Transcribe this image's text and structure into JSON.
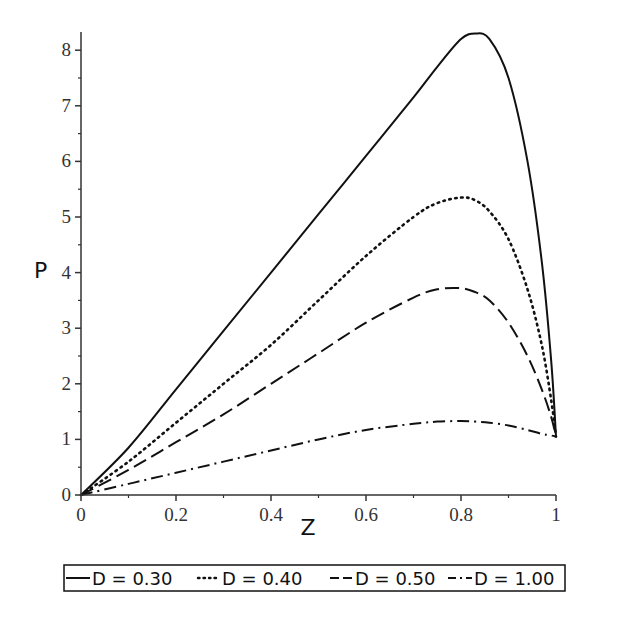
{
  "chart_data": {
    "type": "line",
    "title": "",
    "xlabel": "Z",
    "ylabel": "P",
    "xlim": [
      0,
      1
    ],
    "ylim": [
      0,
      8.3
    ],
    "grid": false,
    "legend_position": "bottom",
    "x_ticks": [
      "0",
      "0.2",
      "0.4",
      "0.6",
      "0.8",
      "1"
    ],
    "y_ticks": [
      "0",
      "1",
      "2",
      "3",
      "4",
      "5",
      "6",
      "7",
      "8"
    ],
    "x": [
      0,
      0.1,
      0.2,
      0.3,
      0.4,
      0.5,
      0.6,
      0.7,
      0.75,
      0.8,
      0.83,
      0.86,
      0.9,
      0.94,
      0.97,
      0.99,
      1.0
    ],
    "series": [
      {
        "name": "D = 0.30",
        "style": "solid",
        "values": [
          0,
          0.85,
          1.9,
          2.95,
          4.0,
          5.05,
          6.1,
          7.15,
          7.7,
          8.2,
          8.3,
          8.2,
          7.5,
          6.0,
          4.2,
          2.4,
          1.05
        ]
      },
      {
        "name": "D = 0.40",
        "style": "dotted",
        "values": [
          0,
          0.6,
          1.3,
          2.0,
          2.7,
          3.5,
          4.3,
          5.0,
          5.25,
          5.35,
          5.3,
          5.1,
          4.6,
          3.7,
          2.7,
          1.7,
          1.05
        ]
      },
      {
        "name": "D = 0.50",
        "style": "dashed",
        "values": [
          0,
          0.45,
          0.95,
          1.45,
          2.0,
          2.55,
          3.1,
          3.55,
          3.7,
          3.72,
          3.65,
          3.5,
          3.1,
          2.5,
          1.9,
          1.4,
          1.05
        ]
      },
      {
        "name": "D = 1.00",
        "style": "dashdot",
        "values": [
          0,
          0.2,
          0.4,
          0.6,
          0.8,
          1.0,
          1.17,
          1.28,
          1.32,
          1.33,
          1.32,
          1.3,
          1.25,
          1.17,
          1.1,
          1.07,
          1.05
        ]
      }
    ]
  },
  "legend": {
    "items": [
      {
        "label": "D = 0.30"
      },
      {
        "label": "D = 0.40"
      },
      {
        "label": "D = 0.50"
      },
      {
        "label": "D = 1.00"
      }
    ]
  },
  "axes": {
    "x_title": "Z",
    "y_title": "P"
  }
}
